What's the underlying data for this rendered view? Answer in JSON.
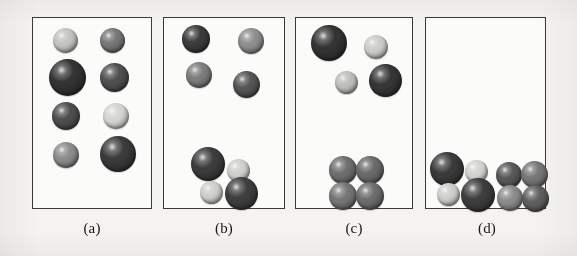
{
  "figure": {
    "background_color": "#f4f3f0",
    "panel_fill": "#fbfbfa",
    "panel_border_color": "#3a3a3a",
    "label_color": "#171717",
    "shade_palette": {
      "very_dark": "#2e2e2e",
      "dark": "#4a4a4a",
      "medium": "#6f6f6f",
      "light_medium": "#8f8f8f",
      "light": "#b9b9b9",
      "very_light": "#d8d8d6"
    },
    "panels": [
      {
        "id": "a",
        "label": "(a)",
        "frame": {
          "x": 32,
          "y": 17,
          "w": 120,
          "h": 192
        },
        "description": "Eight separated spheres of mixed size and shade, dispersed in two columns",
        "sphere_count": 8,
        "spheres": [
          {
            "name": "sphere-a1",
            "cx": 32,
            "cy": 22,
            "r": 12.5,
            "shade": "light",
            "color": "#c3c3c1"
          },
          {
            "name": "sphere-a2",
            "cx": 79,
            "cy": 22,
            "r": 12.5,
            "shade": "medium",
            "color": "#767676"
          },
          {
            "name": "sphere-a3",
            "cx": 34,
            "cy": 59,
            "r": 18.5,
            "shade": "very_dark",
            "color": "#333333"
          },
          {
            "name": "sphere-a4",
            "cx": 81,
            "cy": 59,
            "r": 14.5,
            "shade": "dark",
            "color": "#4f4f4f"
          },
          {
            "name": "sphere-a5",
            "cx": 33,
            "cy": 98,
            "r": 14.0,
            "shade": "dark",
            "color": "#4d4d4d"
          },
          {
            "name": "sphere-a6",
            "cx": 83,
            "cy": 98,
            "r": 13.0,
            "shade": "very_light",
            "color": "#d4d4d1"
          },
          {
            "name": "sphere-a7",
            "cx": 33,
            "cy": 137,
            "r": 13.0,
            "shade": "light_medium",
            "color": "#8b8b8b"
          },
          {
            "name": "sphere-a8",
            "cx": 85,
            "cy": 136,
            "r": 18.0,
            "shade": "very_dark",
            "color": "#3a3a3a"
          }
        ]
      },
      {
        "id": "b",
        "label": "(b)",
        "frame": {
          "x": 163,
          "y": 17,
          "w": 122,
          "h": 192
        },
        "description": "Four dispersed spheres above a single four-sphere cluster resting at the base",
        "sphere_count": 8,
        "spheres": [
          {
            "name": "sphere-b1",
            "cx": 32,
            "cy": 21,
            "r": 14.0,
            "shade": "very_dark",
            "color": "#3b3b3b"
          },
          {
            "name": "sphere-b2",
            "cx": 87,
            "cy": 23,
            "r": 13.0,
            "shade": "light_medium",
            "color": "#8d8d8d"
          },
          {
            "name": "sphere-b3",
            "cx": 35,
            "cy": 57,
            "r": 13.0,
            "shade": "medium",
            "color": "#7c7c7c"
          },
          {
            "name": "sphere-b4",
            "cx": 82,
            "cy": 66,
            "r": 13.5,
            "shade": "dark",
            "color": "#545454"
          },
          {
            "name": "sphere-b5",
            "cx": 44,
            "cy": 146,
            "r": 17.0,
            "shade": "very_dark",
            "color": "#3c3c3c"
          },
          {
            "name": "sphere-b6",
            "cx": 74,
            "cy": 152,
            "r": 11.5,
            "shade": "very_light",
            "color": "#cfcfcc"
          },
          {
            "name": "sphere-b7",
            "cx": 47,
            "cy": 174,
            "r": 11.5,
            "shade": "very_light",
            "color": "#cdcdca"
          },
          {
            "name": "sphere-b8",
            "cx": 77,
            "cy": 175,
            "r": 16.5,
            "shade": "very_dark",
            "color": "#3e3e3e"
          }
        ]
      },
      {
        "id": "c",
        "label": "(c)",
        "frame": {
          "x": 295,
          "y": 17,
          "w": 118,
          "h": 192
        },
        "description": "Four dispersed spheres above a compact two-by-two cluster at the base",
        "sphere_count": 8,
        "spheres": [
          {
            "name": "sphere-c1",
            "cx": 33,
            "cy": 25,
            "r": 18.0,
            "shade": "very_dark",
            "color": "#333333"
          },
          {
            "name": "sphere-c2",
            "cx": 80,
            "cy": 29,
            "r": 12.0,
            "shade": "very_light",
            "color": "#cbcbc8"
          },
          {
            "name": "sphere-c3",
            "cx": 50,
            "cy": 64,
            "r": 11.5,
            "shade": "light",
            "color": "#bdbdba"
          },
          {
            "name": "sphere-c4",
            "cx": 89,
            "cy": 62,
            "r": 16.5,
            "shade": "very_dark",
            "color": "#363636"
          },
          {
            "name": "sphere-c5",
            "cx": 47,
            "cy": 152,
            "r": 14.0,
            "shade": "medium",
            "color": "#6e6e6e"
          },
          {
            "name": "sphere-c6",
            "cx": 74,
            "cy": 152,
            "r": 14.0,
            "shade": "medium",
            "color": "#6a6a6a"
          },
          {
            "name": "sphere-c7",
            "cx": 47,
            "cy": 178,
            "r": 14.0,
            "shade": "medium",
            "color": "#757575"
          },
          {
            "name": "sphere-c8",
            "cx": 74,
            "cy": 178,
            "r": 14.0,
            "shade": "medium",
            "color": "#6c6c6c"
          }
        ]
      },
      {
        "id": "d",
        "label": "(d)",
        "frame": {
          "x": 425,
          "y": 17,
          "w": 121,
          "h": 192
        },
        "description": "All spheres condensed into two four-sphere clusters settled along the base, upper region empty",
        "sphere_count": 8,
        "spheres": [
          {
            "name": "sphere-d1",
            "cx": 21,
            "cy": 151,
            "r": 17.0,
            "shade": "very_dark",
            "color": "#3a3a3a"
          },
          {
            "name": "sphere-d2",
            "cx": 50,
            "cy": 153,
            "r": 11.5,
            "shade": "very_light",
            "color": "#d2d2cf"
          },
          {
            "name": "sphere-d3",
            "cx": 22,
            "cy": 176,
            "r": 11.5,
            "shade": "very_light",
            "color": "#cdcdca"
          },
          {
            "name": "sphere-d4",
            "cx": 52,
            "cy": 177,
            "r": 17.0,
            "shade": "very_dark",
            "color": "#3d3d3d"
          },
          {
            "name": "sphere-d5",
            "cx": 83,
            "cy": 157,
            "r": 13.0,
            "shade": "dark",
            "color": "#575757"
          },
          {
            "name": "sphere-d6",
            "cx": 108,
            "cy": 156,
            "r": 13.5,
            "shade": "medium",
            "color": "#757575"
          },
          {
            "name": "sphere-d7",
            "cx": 84,
            "cy": 180,
            "r": 13.0,
            "shade": "light_medium",
            "color": "#8a8a8a"
          },
          {
            "name": "sphere-d8",
            "cx": 109,
            "cy": 180,
            "r": 13.5,
            "shade": "dark",
            "color": "#5e5e5e"
          }
        ]
      }
    ],
    "labels": [
      {
        "text": "(a)",
        "cx": 92,
        "y": 220
      },
      {
        "text": "(b)",
        "cx": 224,
        "y": 220
      },
      {
        "text": "(c)",
        "cx": 354,
        "y": 220
      },
      {
        "text": "(d)",
        "cx": 487,
        "y": 220
      }
    ]
  }
}
